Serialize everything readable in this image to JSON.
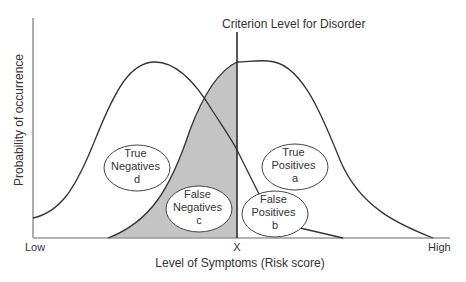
{
  "title": "Criterion Level for Disorder",
  "axes": {
    "ylabel": "Probability of occurrence",
    "xlabel": "Level of Symptoms (Risk score)",
    "x_ticks": {
      "low": "Low",
      "criterion": "X",
      "high": "High"
    }
  },
  "regions": {
    "true_negatives": {
      "line1": "True",
      "line2": "Negatives",
      "letter": "d"
    },
    "true_positives": {
      "line1": "True",
      "line2": "Positives",
      "letter": "a"
    },
    "false_negatives": {
      "line1": "False",
      "line2": "Negatives",
      "letter": "c"
    },
    "false_positives": {
      "line1": "False",
      "line2": "Positives",
      "letter": "b"
    }
  },
  "colors": {
    "shade": "#c4c4c4",
    "line": "#333333",
    "axis": "#888888"
  }
}
